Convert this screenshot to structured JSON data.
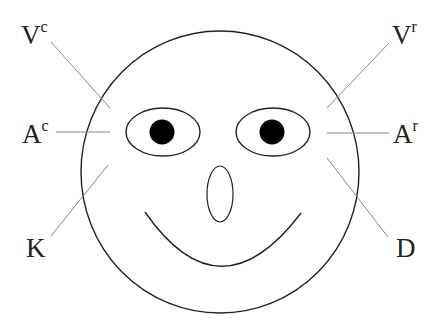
{
  "diagram": {
    "type": "face-labeled-diagram",
    "labels": [
      {
        "id": "vc",
        "base": "V",
        "sup": "c"
      },
      {
        "id": "vr",
        "base": "V",
        "sup": "r"
      },
      {
        "id": "ac",
        "base": "A",
        "sup": "c"
      },
      {
        "id": "ar",
        "base": "A",
        "sup": "r"
      },
      {
        "id": "k",
        "base": "K",
        "sup": ""
      },
      {
        "id": "d",
        "base": "D",
        "sup": ""
      }
    ],
    "colors": {
      "stroke": "#222222",
      "leader": "#888888",
      "pupil": "#000000"
    }
  }
}
